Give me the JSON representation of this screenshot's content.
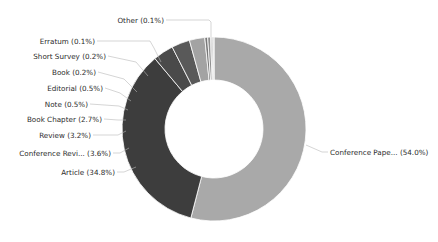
{
  "chart_data": {
    "type": "pie",
    "variant": "donut",
    "title": "",
    "xlabel": "",
    "ylabel": "",
    "legend_position": "none",
    "grid": false,
    "value_unit": "percent",
    "label_format": "{name} ({value}%)",
    "categories": [
      "Conference Pape...",
      "Article",
      "Conference Revi...",
      "Review",
      "Book Chapter",
      "Note",
      "Editorial",
      "Book",
      "Short Survey",
      "Erratum",
      "Other"
    ],
    "values": [
      54.0,
      34.8,
      3.6,
      3.2,
      2.7,
      0.5,
      0.5,
      0.2,
      0.2,
      0.1,
      0.1
    ],
    "colors": [
      "#a9a9a9",
      "#3d3d3d",
      "#4a4a4a",
      "#595959",
      "#a3a3a3",
      "#787878",
      "#8f8f8f",
      "#6b6b6b",
      "#555555",
      "#9c9c9c",
      "#1a1a1a"
    ],
    "slices": [
      {
        "name": "Conference Pape...",
        "value": 54.0,
        "label": "Conference Pape... (54.0%)",
        "color": "#a9a9a9"
      },
      {
        "name": "Article",
        "value": 34.8,
        "label": "Article (34.8%)",
        "color": "#3d3d3d"
      },
      {
        "name": "Conference Revi...",
        "value": 3.6,
        "label": "Conference Revi... (3.6%)",
        "color": "#4a4a4a"
      },
      {
        "name": "Review",
        "value": 3.2,
        "label": "Review (3.2%)",
        "color": "#595959"
      },
      {
        "name": "Book Chapter",
        "value": 2.7,
        "label": "Book Chapter (2.7%)",
        "color": "#a3a3a3"
      },
      {
        "name": "Note",
        "value": 0.5,
        "label": "Note (0.5%)",
        "color": "#787878"
      },
      {
        "name": "Editorial",
        "value": 0.5,
        "label": "Editorial (0.5%)",
        "color": "#8f8f8f"
      },
      {
        "name": "Book",
        "value": 0.2,
        "label": "Book (0.2%)",
        "color": "#6b6b6b"
      },
      {
        "name": "Short Survey",
        "value": 0.2,
        "label": "Short Survey (0.2%)",
        "color": "#555555"
      },
      {
        "name": "Erratum",
        "value": 0.1,
        "label": "Erratum (0.1%)",
        "color": "#9c9c9c"
      },
      {
        "name": "Other",
        "value": 0.1,
        "label": "Other (0.1%)",
        "color": "#1a1a1a"
      }
    ],
    "geometry": {
      "center_x": 214,
      "center_y": 129,
      "outer_radius": 92,
      "inner_radius": 49,
      "start_angle_deg": 0,
      "direction": "clockwise"
    }
  },
  "labels": {
    "conference_paper": "Conference Pape... (54.0%)",
    "article": "Article (34.8%)",
    "conference_review": "Conference Revi... (3.6%)",
    "review": "Review (3.2%)",
    "book_chapter": "Book Chapter (2.7%)",
    "note": "Note (0.5%)",
    "editorial": "Editorial (0.5%)",
    "book": "Book (0.2%)",
    "short_survey": "Short Survey (0.2%)",
    "erratum": "Erratum (0.1%)",
    "other": "Other (0.1%)"
  },
  "style": {
    "background": "#ffffff",
    "text_color": "#2b2b2b",
    "leader_color": "#b8b8b8",
    "primary_color": "#a9a9a9",
    "secondary_color": "#3d3d3d"
  }
}
